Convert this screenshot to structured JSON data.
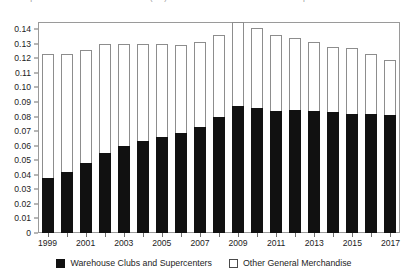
{
  "chart_data": {
    "type": "bar",
    "title": "2. Components of General Merchandise (4%) as Share of Total Household Consumption",
    "subtitle": "",
    "xlabel": "",
    "ylabel": "",
    "stacked": true,
    "grid": false,
    "legend_position": "bottom-center",
    "ylim": [
      0,
      0.145
    ],
    "ytick_values": [
      0,
      0.01,
      0.02,
      0.03,
      0.04,
      0.05,
      0.06,
      0.07,
      0.08,
      0.09,
      0.1,
      0.11,
      0.12,
      0.13,
      0.14
    ],
    "ytick_labels": [
      "0",
      "0.01",
      "0.02",
      "0.03",
      "0.04",
      "0.05",
      "0.06",
      "0.07",
      "0.08",
      "0.09",
      "0.10",
      "0.11",
      "0.12",
      "0.13",
      "0.14"
    ],
    "categories": [
      1999,
      2000,
      2001,
      2002,
      2003,
      2004,
      2005,
      2006,
      2007,
      2008,
      2009,
      2010,
      2011,
      2012,
      2013,
      2014,
      2015,
      2016,
      2017
    ],
    "xtick_labels": [
      "1999",
      "",
      "2001",
      "",
      "2003",
      "",
      "2005",
      "",
      "2007",
      "",
      "2009",
      "",
      "2011",
      "",
      "2013",
      "",
      "2015",
      "",
      "2017"
    ],
    "series": [
      {
        "name": "Warehouse Clubs and Supercenters",
        "color": "#111111",
        "style": "filled",
        "values": [
          0.038,
          0.042,
          0.048,
          0.055,
          0.06,
          0.063,
          0.066,
          0.069,
          0.073,
          0.08,
          0.087,
          0.086,
          0.084,
          0.0845,
          0.084,
          0.083,
          0.082,
          0.0815,
          0.081
        ]
      },
      {
        "name": "Other General Merchandise",
        "color": "#ffffff",
        "style": "hollow",
        "values": [
          0.085,
          0.081,
          0.078,
          0.075,
          0.07,
          0.067,
          0.064,
          0.06,
          0.058,
          0.056,
          0.058,
          0.055,
          0.052,
          0.0495,
          0.047,
          0.045,
          0.045,
          0.0415,
          0.038
        ]
      }
    ],
    "totals": [
      0.123,
      0.123,
      0.126,
      0.13,
      0.13,
      0.13,
      0.13,
      0.129,
      0.131,
      0.136,
      0.145,
      0.141,
      0.136,
      0.134,
      0.131,
      0.128,
      0.127,
      0.123,
      0.119
    ]
  },
  "legend": {
    "items": [
      {
        "label": "Warehouse Clubs and Supercenters",
        "style": "filled"
      },
      {
        "label": "Other General Merchandise",
        "style": "hollow"
      }
    ]
  },
  "axes": {
    "zero_label": "0"
  }
}
